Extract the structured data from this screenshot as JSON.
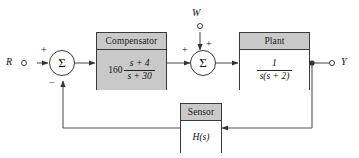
{
  "diagram": {
    "type": "control-system-block-diagram",
    "signals": {
      "input_label": "R",
      "disturbance_label": "W",
      "output_label": "Y"
    },
    "summing_junctions": [
      {
        "id": "sum-error",
        "symbol": "Σ",
        "signs": {
          "input": "+",
          "feedback": "−"
        }
      },
      {
        "id": "sum-disturbance",
        "symbol": "Σ",
        "signs": {
          "input": "+",
          "disturbance": "+"
        }
      }
    ],
    "blocks": [
      {
        "id": "compensator",
        "title": "Compensator",
        "gain": "160",
        "numerator": "s + 4",
        "denominator": "s + 30",
        "shaded": true
      },
      {
        "id": "plant",
        "title": "Plant",
        "gain": "",
        "numerator": "1",
        "denominator": "s(s + 2)",
        "shaded": false
      },
      {
        "id": "sensor",
        "title": "Sensor",
        "transfer_function": "H(s)",
        "shaded": false
      }
    ],
    "colors": {
      "line": "#555555",
      "block_border": "#3a3a3a",
      "header_fill": "#c9c9c9",
      "body_fill_shaded": "#c9c9c9",
      "body_fill_plain": "#ffffff",
      "background": "#ffffff"
    }
  }
}
